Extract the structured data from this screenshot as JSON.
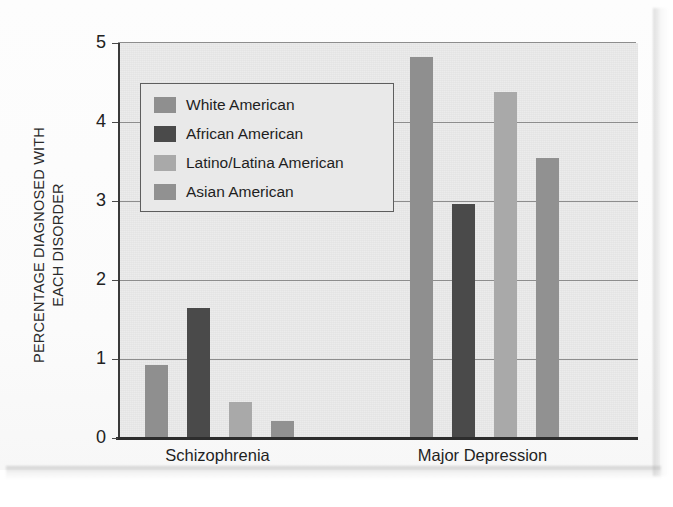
{
  "chart_data": {
    "type": "bar",
    "title": "",
    "subtitle": "",
    "xlabel": "",
    "ylabel": "PERCENTAGE DIAGNOSED WITH EACH DISORDER",
    "ylabel_line1": "PERCENTAGE DIAGNOSED WITH",
    "ylabel_line2": "EACH DISORDER",
    "categories": [
      "Schizophrenia",
      "Major Depression"
    ],
    "ylim": [
      0,
      5
    ],
    "yticks": [
      0,
      1,
      2,
      3,
      4,
      5
    ],
    "ytick_labels": [
      "0",
      "1",
      "2",
      "3",
      "4",
      "5"
    ],
    "grid": true,
    "grid_axis": "y",
    "legend_position": "upper-left-inside",
    "series": [
      {
        "name": "White American",
        "color": "#8f8f8f",
        "values": [
          0.93,
          4.82
        ]
      },
      {
        "name": "African American",
        "color": "#4a4a4a",
        "values": [
          1.65,
          2.96
        ]
      },
      {
        "name": "Latino/Latina American",
        "color": "#a9a9a9",
        "values": [
          0.46,
          4.38
        ]
      },
      {
        "name": "Asian American",
        "color": "#919191",
        "values": [
          0.22,
          3.54
        ]
      }
    ]
  },
  "style": {
    "plot_background": "#e8e8e8",
    "gridline_color": "#8d8d8d",
    "axis_color": "#2d2d2d",
    "text_color": "#1f1f1f",
    "legend_background": "#e9e9e9",
    "legend_border": "#5e5e5e",
    "page_background": "#ffffff"
  }
}
